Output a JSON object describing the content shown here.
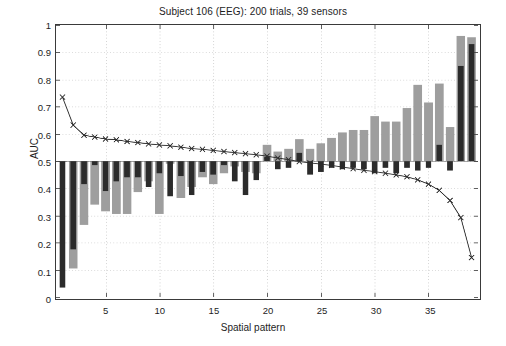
{
  "chart_data": {
    "type": "bar",
    "title": "Subject 106 (EEG): 200 trials, 39 sensors",
    "xlabel": "Spatial pattern",
    "ylabel": "AUC",
    "xlim": [
      0.4,
      39.6
    ],
    "ylim": [
      0,
      1
    ],
    "grid": true,
    "grid_style": "dotted",
    "legend": "none",
    "baseline": 0.5,
    "yticks": [
      0,
      0.1,
      0.2,
      0.3,
      0.4,
      0.5,
      0.6,
      0.7,
      0.8,
      0.9,
      1
    ],
    "ytick_labels": [
      "0",
      "0.1",
      "0.2",
      "0.3",
      "0.4",
      "0.5",
      "0.6",
      "0.7",
      "0.8",
      "0.9",
      "1"
    ],
    "xticks": [
      5,
      10,
      15,
      20,
      25,
      30,
      35
    ],
    "xtick_labels": [
      "5",
      "10",
      "15",
      "20",
      "25",
      "30",
      "35"
    ],
    "x": [
      1,
      2,
      3,
      4,
      5,
      6,
      7,
      8,
      9,
      10,
      11,
      12,
      13,
      14,
      15,
      16,
      17,
      18,
      19,
      20,
      21,
      22,
      23,
      24,
      25,
      26,
      27,
      28,
      29,
      30,
      31,
      32,
      33,
      34,
      35,
      36,
      37,
      38,
      39
    ],
    "series": [
      {
        "name": "gray-bars",
        "type": "bar",
        "color": "#9e9e9e",
        "values": [
          0.5,
          0.105,
          0.265,
          0.34,
          0.315,
          0.305,
          0.305,
          0.385,
          0.425,
          0.305,
          0.49,
          0.365,
          0.405,
          0.44,
          0.415,
          0.455,
          0.48,
          0.46,
          0.455,
          0.56,
          0.535,
          0.545,
          0.58,
          0.545,
          0.565,
          0.585,
          0.605,
          0.615,
          0.615,
          0.665,
          0.645,
          0.645,
          0.695,
          0.78,
          0.715,
          0.785,
          0.625,
          0.96,
          0.955
        ]
      },
      {
        "name": "dark-bars",
        "type": "bar",
        "color": "#2b2b2b",
        "values": [
          0.035,
          0.175,
          0.415,
          0.485,
          0.39,
          0.425,
          0.44,
          0.44,
          0.405,
          0.455,
          0.37,
          0.445,
          0.375,
          0.46,
          0.45,
          0.485,
          0.425,
          0.375,
          0.43,
          0.515,
          0.47,
          0.475,
          0.53,
          0.45,
          0.46,
          0.475,
          0.47,
          0.475,
          0.47,
          0.455,
          0.475,
          0.455,
          0.475,
          0.465,
          0.475,
          0.56,
          0.465,
          0.85,
          0.93
        ]
      },
      {
        "name": "auc-line",
        "type": "line",
        "color": "#2b2b2b",
        "marker": "x",
        "values": [
          0.735,
          0.632,
          0.595,
          0.588,
          0.581,
          0.578,
          0.572,
          0.568,
          0.563,
          0.559,
          0.556,
          0.551,
          0.546,
          0.543,
          0.539,
          0.535,
          0.531,
          0.527,
          0.523,
          0.518,
          0.511,
          0.505,
          0.498,
          0.493,
          0.489,
          0.484,
          0.478,
          0.472,
          0.466,
          0.461,
          0.455,
          0.449,
          0.442,
          0.431,
          0.415,
          0.392,
          0.355,
          0.292,
          0.145
        ]
      }
    ]
  },
  "axes": {
    "title": "Subject 106 (EEG): 200 trials, 39 sensors",
    "xlabel": "Spatial pattern",
    "ylabel": "AUC"
  }
}
